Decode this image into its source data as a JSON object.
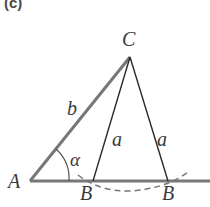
{
  "figure": {
    "panel_label": "(c)",
    "vertices": {
      "A": {
        "label": "A",
        "x": 30,
        "y": 181
      },
      "B1": {
        "label": "B",
        "x": 93,
        "y": 181
      },
      "B2": {
        "label": "B",
        "x": 168,
        "y": 181
      },
      "C": {
        "label": "C",
        "x": 130,
        "y": 57
      }
    },
    "sides": {
      "b": "b",
      "a_left": "a",
      "a_right": "a"
    },
    "angle": "α",
    "colors": {
      "thick_side": "#777777",
      "thin_side": "#2a2a2a",
      "dashed_arc": "#777777",
      "text": "#3a3a3a"
    }
  }
}
